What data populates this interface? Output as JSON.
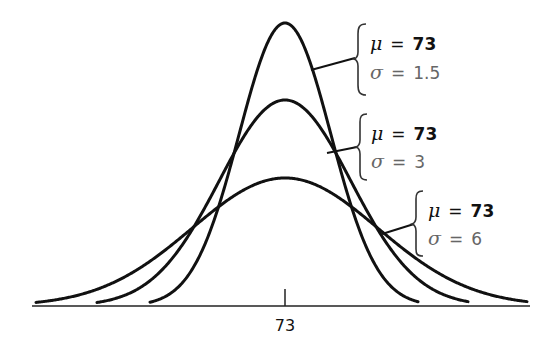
{
  "chart_data": {
    "type": "line",
    "title": "",
    "xlabel": "",
    "ylabel": "",
    "grid": false,
    "legend_position": "annotations-right",
    "x_ticks": [
      {
        "value": 73,
        "label": "73"
      }
    ],
    "series": [
      {
        "name": "mu=73, sigma=1.5",
        "mu": 73,
        "sigma": 1.5,
        "mu_label": "μ = 73",
        "sigma_label": "σ = 1.5",
        "mu_text": "73",
        "sigma_text": "1.5",
        "peak_px": 283,
        "spread_px": 45.9,
        "x_start_px": 150,
        "x_end_px": 418
      },
      {
        "name": "mu=73, sigma=3",
        "mu": 73,
        "sigma": 3,
        "mu_label": "μ = 73",
        "sigma_label": "σ = 3",
        "mu_text": "73",
        "sigma_text": "3",
        "peak_px": 206,
        "spread_px": 65.9,
        "x_start_px": 97,
        "x_end_px": 468
      },
      {
        "name": "mu=73, sigma=6",
        "mu": 73,
        "sigma": 6,
        "mu_label": "μ = 73",
        "sigma_label": "σ = 6",
        "mu_text": "73",
        "sigma_text": "6",
        "peak_px": 128,
        "spread_px": 93.1,
        "x_start_px": 36,
        "x_end_px": 527
      }
    ],
    "annotations": [
      {
        "series": 0,
        "text": [
          "μ = 73",
          "σ = 1.5"
        ]
      },
      {
        "series": 1,
        "text": [
          "μ = 73",
          "σ = 3"
        ]
      },
      {
        "series": 2,
        "text": [
          "μ = 73",
          "σ = 6"
        ]
      }
    ]
  },
  "labels": {
    "mu_symbol": "μ",
    "sigma_symbol": "σ",
    "equals": "=",
    "tick_73": "73",
    "a1_mu": "73",
    "a1_sigma": "1.5",
    "a2_mu": "73",
    "a2_sigma": "3",
    "a3_mu": "73",
    "a3_sigma": "6"
  },
  "colors": {
    "curve": "#111111",
    "mu_text": "#111111",
    "sigma_text": "#666666",
    "background": "#ffffff"
  }
}
